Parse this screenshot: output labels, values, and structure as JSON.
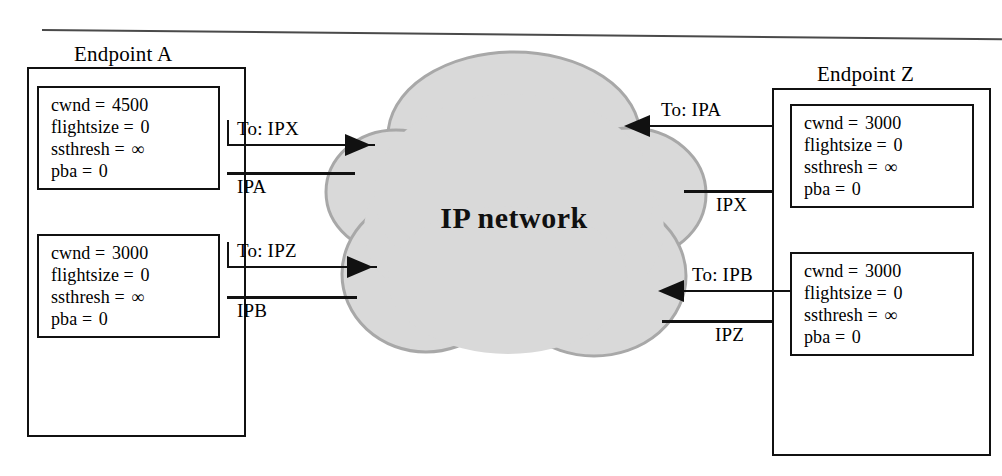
{
  "figure": {
    "cloud_label": "IP network",
    "cloud_fill": "#d9d9d9",
    "cloud_stroke": "#9a9a9a",
    "line_color": "#111111"
  },
  "endpoints": {
    "a": {
      "title": "Endpoint A",
      "states": [
        {
          "lines": [
            {
              "name": "cwnd",
              "eq": "=",
              "value": "4500"
            },
            {
              "name": "flightsize",
              "eq": "=",
              "value": "0"
            },
            {
              "name": "ssthresh",
              "eq": "=",
              "value": "∞"
            },
            {
              "name": "pba",
              "eq": "=",
              "value": "0"
            }
          ]
        },
        {
          "lines": [
            {
              "name": "cwnd",
              "eq": "=",
              "value": "3000"
            },
            {
              "name": "flightsize",
              "eq": "=",
              "value": "0"
            },
            {
              "name": "ssthresh",
              "eq": "=",
              "value": "∞"
            },
            {
              "name": "pba",
              "eq": "=",
              "value": "0"
            }
          ]
        }
      ]
    },
    "z": {
      "title": "Endpoint Z",
      "states": [
        {
          "lines": [
            {
              "name": "cwnd",
              "eq": "=",
              "value": "3000"
            },
            {
              "name": "flightsize",
              "eq": "=",
              "value": "0"
            },
            {
              "name": "ssthresh",
              "eq": "=",
              "value": "∞"
            },
            {
              "name": "pba",
              "eq": "=",
              "value": "0"
            }
          ]
        },
        {
          "lines": [
            {
              "name": "cwnd",
              "eq": "=",
              "value": "3000"
            },
            {
              "name": "flightsize",
              "eq": "=",
              "value": "0"
            },
            {
              "name": "ssthresh",
              "eq": "=",
              "value": "∞"
            },
            {
              "name": "pba",
              "eq": "=",
              "value": "0"
            }
          ]
        }
      ]
    }
  },
  "links": {
    "a_upper_dest": "To: IPX",
    "a_upper_src": "IPA",
    "a_lower_dest": "To: IPZ",
    "a_lower_src": "IPB",
    "z_upper_dest": "To: IPA",
    "z_upper_src": "IPX",
    "z_lower_dest": "To: IPB",
    "z_lower_src": "IPZ"
  }
}
